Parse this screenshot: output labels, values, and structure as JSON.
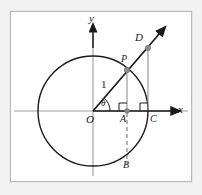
{
  "figure": {
    "type": "geometry-diagram",
    "background_color": "#f2f2f2",
    "panel_color": "#ffffff",
    "frame_border_color": "#b9b9b9",
    "stroke_color": "#1a1a1a",
    "axis_color": "#8d8d8d",
    "helper_line_color": "#9a9a9a",
    "point_fill_color": "#8c8c8c"
  },
  "axes": {
    "x_label": "x",
    "y_label": "y",
    "origin_label": "O"
  },
  "labels": {
    "radius": "1",
    "angle": "θ",
    "point_p": "P",
    "point_d": "D",
    "point_a": "A",
    "point_b": "B",
    "point_c": "C"
  },
  "geometry": {
    "origin": {
      "x": 93,
      "y": 111
    },
    "circle_radius": 55,
    "theta_degrees": 50,
    "points": {
      "P": {
        "x": 127,
        "y": 70
      },
      "D": {
        "x": 148,
        "y": 48
      },
      "A": {
        "x": 127,
        "y": 111
      },
      "B": {
        "x": 127,
        "y": 166
      },
      "C": {
        "x": 148,
        "y": 111
      }
    },
    "ray_arrow_tip": {
      "x": 162,
      "y": 31
    },
    "x_axis_arrow_tip": {
      "x": 173,
      "y": 111
    },
    "y_axis_arrow_tip": {
      "x": 93,
      "y": 29
    }
  }
}
